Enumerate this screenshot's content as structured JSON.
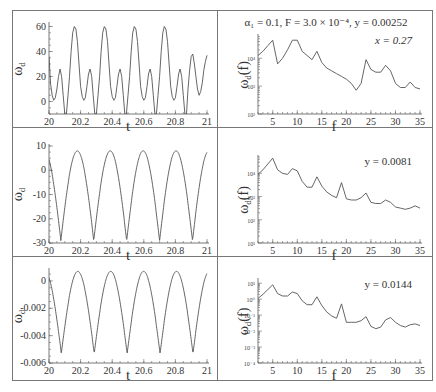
{
  "figure": {
    "title": "α₁ = 0.1,  F = 3.0 × 10⁻⁴, y = 0.00252"
  },
  "chart_data": [
    {
      "id": "row1-time",
      "type": "line",
      "xlabel": "t",
      "ylabel": "ω_d",
      "xlim": [
        20,
        21
      ],
      "ylim": [
        -10,
        62
      ],
      "xticks": [
        "20",
        "20.2",
        "20.4",
        "20.6",
        "20.8",
        "21"
      ],
      "xtick_values": [
        20,
        20.2,
        20.4,
        20.6,
        20.8,
        21
      ],
      "yticks": [
        "0",
        "20",
        "40",
        "60"
      ],
      "ytick_values": [
        0,
        20,
        40,
        60
      ],
      "series": [
        {
          "name": "omega_d",
          "x": [
            20.0,
            20.01,
            20.02,
            20.03,
            20.04,
            20.05,
            20.06,
            20.07,
            20.08,
            20.09,
            20.1,
            20.11,
            20.12,
            20.13,
            20.14,
            20.15,
            20.16,
            20.17,
            20.18,
            20.19,
            20.2,
            20.21,
            20.22,
            20.23,
            20.24,
            20.25,
            20.26,
            20.27,
            20.28,
            20.29,
            20.3,
            20.31,
            20.32,
            20.33,
            20.34,
            20.35,
            20.36,
            20.37,
            20.38,
            20.39,
            20.4,
            20.41,
            20.42,
            20.43,
            20.44,
            20.45,
            20.46,
            20.47,
            20.48,
            20.49,
            20.5,
            20.51,
            20.52,
            20.53,
            20.54,
            20.55,
            20.56,
            20.57,
            20.58,
            20.59,
            20.6,
            20.61,
            20.62,
            20.63,
            20.64,
            20.65,
            20.66,
            20.67,
            20.68,
            20.69,
            20.7,
            20.71,
            20.72,
            20.73,
            20.74,
            20.75,
            20.76,
            20.77,
            20.78,
            20.79,
            20.8,
            20.81,
            20.82,
            20.83,
            20.84,
            20.85,
            20.86,
            20.87,
            20.88,
            20.89,
            20.9,
            20.91,
            20.92,
            20.93,
            20.94,
            20.95,
            20.96,
            20.97,
            20.98,
            20.99,
            21.0
          ],
          "y": [
            36,
            14,
            5,
            1,
            3,
            10,
            20,
            26,
            20,
            5,
            -10,
            -10,
            5,
            20,
            40,
            55,
            60,
            58,
            48,
            30,
            12,
            4,
            1,
            3,
            12,
            22,
            26,
            20,
            5,
            -10,
            -10,
            5,
            20,
            40,
            55,
            60,
            58,
            48,
            30,
            12,
            4,
            1,
            3,
            12,
            22,
            26,
            20,
            5,
            -10,
            -10,
            5,
            20,
            40,
            55,
            60,
            58,
            48,
            30,
            12,
            4,
            1,
            3,
            12,
            22,
            26,
            20,
            5,
            -10,
            -10,
            5,
            20,
            40,
            55,
            60,
            58,
            48,
            30,
            12,
            4,
            1,
            3,
            12,
            22,
            26,
            20,
            5,
            -10,
            -10,
            10,
            25,
            36,
            38,
            30,
            20,
            10,
            5,
            8,
            15,
            25,
            32,
            37
          ]
        }
      ]
    },
    {
      "id": "row1-spectrum",
      "type": "line",
      "xlabel": "f",
      "ylabel": "ω_d(f)",
      "yscale": "log",
      "xlim": [
        2,
        35
      ],
      "ylim_exp": [
        2,
        4.8
      ],
      "xticks": [
        "5",
        "10",
        "15",
        "20",
        "25",
        "30",
        "35"
      ],
      "xtick_values": [
        5,
        10,
        15,
        20,
        25,
        30,
        35
      ],
      "yticks": [
        "10²",
        "10³",
        "10⁴"
      ],
      "ytick_exps": [
        2,
        3,
        4
      ],
      "annotation": "x = 0.27",
      "series": [
        {
          "name": "spectrum",
          "x": [
            2,
            3,
            4,
            5,
            6,
            7,
            8,
            9,
            10,
            11,
            12,
            13,
            14,
            15,
            16,
            17,
            18,
            19,
            20,
            21,
            22,
            23,
            24,
            25,
            26,
            27,
            28,
            29,
            30,
            31,
            32,
            33,
            34,
            35
          ],
          "log10y": [
            4.1,
            4.25,
            4.45,
            4.65,
            3.8,
            4.0,
            4.3,
            4.65,
            4.65,
            4.25,
            4.1,
            3.95,
            4.25,
            3.85,
            3.65,
            3.55,
            3.45,
            3.35,
            3.25,
            3.1,
            2.85,
            3.1,
            3.95,
            3.6,
            3.5,
            3.5,
            3.75,
            3.55,
            3.1,
            2.95,
            2.95,
            3.15,
            2.95,
            2.9
          ]
        }
      ]
    },
    {
      "id": "row2-time",
      "type": "line",
      "xlabel": "t",
      "ylabel": "ω_d",
      "xlim": [
        20,
        21
      ],
      "ylim": [
        -30,
        10
      ],
      "xticks": [
        "20",
        "20.2",
        "20.4",
        "20.6",
        "20.8",
        "21"
      ],
      "xtick_values": [
        20,
        20.2,
        20.4,
        20.6,
        20.8,
        21
      ],
      "yticks": [
        "-30",
        "-20",
        "-10",
        "0",
        "10"
      ],
      "ytick_values": [
        -30,
        -20,
        -10,
        0,
        10
      ],
      "series": [
        {
          "name": "omega_d",
          "period": 0.2083,
          "phase_min": 20.075,
          "min": -29,
          "max": 8
        }
      ]
    },
    {
      "id": "row2-spectrum",
      "type": "line",
      "xlabel": "f",
      "ylabel": "ω_d(f)",
      "yscale": "log",
      "xlim": [
        2,
        35
      ],
      "ylim_exp": [
        1,
        4.7
      ],
      "xticks": [
        "5",
        "10",
        "15",
        "20",
        "25",
        "30",
        "35"
      ],
      "xtick_values": [
        5,
        10,
        15,
        20,
        25,
        30,
        35
      ],
      "yticks": [
        "10¹",
        "10²",
        "10³",
        "10⁴"
      ],
      "ytick_exps": [
        1,
        2,
        3,
        4
      ],
      "annotation": "y = 0.0081",
      "series": [
        {
          "name": "spectrum",
          "x": [
            2,
            3,
            4,
            5,
            6,
            7,
            8,
            9,
            10,
            11,
            12,
            13,
            14,
            15,
            16,
            17,
            18,
            19,
            20,
            21,
            22,
            23,
            24,
            25,
            26,
            27,
            28,
            29,
            30,
            31,
            32,
            33,
            34,
            35
          ],
          "log10y": [
            3.95,
            4.15,
            4.4,
            4.65,
            4.15,
            4.0,
            3.95,
            4.2,
            4.1,
            3.65,
            3.4,
            3.4,
            3.85,
            3.45,
            3.2,
            3.05,
            2.95,
            3.6,
            2.9,
            2.85,
            2.85,
            2.95,
            3.15,
            2.75,
            2.7,
            2.7,
            2.85,
            2.75,
            2.55,
            2.5,
            2.45,
            2.5,
            2.6,
            2.5
          ]
        }
      ]
    },
    {
      "id": "row3-time",
      "type": "line",
      "xlabel": "t",
      "ylabel": "ω_d",
      "xlim": [
        20,
        21
      ],
      "ylim": [
        -0.006,
        0.0008
      ],
      "xticks": [
        "20",
        "20.2",
        "20.4",
        "20.6",
        "20.8",
        "21"
      ],
      "xtick_values": [
        20,
        20.2,
        20.4,
        20.6,
        20.8,
        21
      ],
      "yticks": [
        "-0.006",
        "-0.004",
        "-0.002",
        "0"
      ],
      "ytick_values": [
        -0.006,
        -0.004,
        -0.002,
        0
      ],
      "series": [
        {
          "name": "omega_d",
          "period": 0.2083,
          "phase_min": 20.078,
          "min": -0.0053,
          "max": 0.0007
        }
      ]
    },
    {
      "id": "row3-spectrum",
      "type": "line",
      "xlabel": "f",
      "ylabel": "ω_d(f)",
      "yscale": "log",
      "xlim": [
        2,
        35
      ],
      "ylim_exp": [
        -4,
        1.2
      ],
      "xticks": [
        "5",
        "10",
        "15",
        "20",
        "25",
        "30",
        "35"
      ],
      "xtick_values": [
        5,
        10,
        15,
        20,
        25,
        30,
        35
      ],
      "yticks": [
        "10⁻⁴",
        "10⁻³",
        "10⁻²",
        "10⁻¹",
        "10⁰",
        "10¹"
      ],
      "ytick_exps": [
        -4,
        -3,
        -2,
        -1,
        0,
        1
      ],
      "annotation": "y = 0.0144",
      "series": [
        {
          "name": "spectrum",
          "x": [
            2,
            3,
            4,
            5,
            6,
            7,
            8,
            9,
            10,
            11,
            12,
            13,
            14,
            15,
            16,
            17,
            18,
            19,
            20,
            21,
            22,
            23,
            24,
            25,
            26,
            27,
            28,
            29,
            30,
            31,
            32,
            33,
            34,
            35
          ],
          "log10y": [
            0.05,
            0.3,
            0.6,
            0.9,
            0.35,
            0.2,
            0.2,
            0.45,
            0.35,
            -0.1,
            -0.35,
            -0.35,
            0.15,
            -0.4,
            -0.8,
            -1.05,
            -1.2,
            -0.3,
            -1.45,
            -1.45,
            -1.45,
            -1.35,
            -1.1,
            -1.7,
            -1.85,
            -1.75,
            -1.3,
            -1.15,
            -1.45,
            -1.65,
            -1.75,
            -1.6,
            -1.55,
            -1.65
          ]
        }
      ]
    }
  ]
}
